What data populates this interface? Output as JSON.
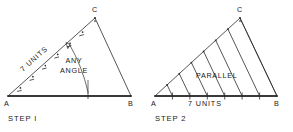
{
  "figure": {
    "background_color": "#ffffff",
    "ink_color": "#2b2b2b",
    "baseline_color": "#3a3a3a",
    "panels": [
      {
        "id": "step-1",
        "step_label": "STEP I",
        "vertices": {
          "a": "A",
          "b": "B",
          "c": "C"
        },
        "geometry": {
          "a": [
            8,
            96
          ],
          "b": [
            131,
            96
          ],
          "c": [
            95,
            18
          ],
          "divisions": 7
        },
        "annotations": [
          {
            "name": "units-label",
            "text": "7 UNITS",
            "rotated": true
          },
          {
            "name": "any-angle-label",
            "line1": "ANY",
            "line2": "ANGLE"
          }
        ]
      },
      {
        "id": "step-2",
        "step_label": "STEP 2",
        "vertices": {
          "a": "A",
          "b": "B",
          "c": "C"
        },
        "geometry": {
          "a": [
            155,
            96
          ],
          "b": [
            277,
            96
          ],
          "c": [
            240,
            18
          ],
          "divisions": 7
        },
        "annotations": [
          {
            "name": "parallel-label",
            "text": "PARALLEL"
          },
          {
            "name": "units-label",
            "text": "7 UNITS"
          }
        ]
      }
    ]
  }
}
